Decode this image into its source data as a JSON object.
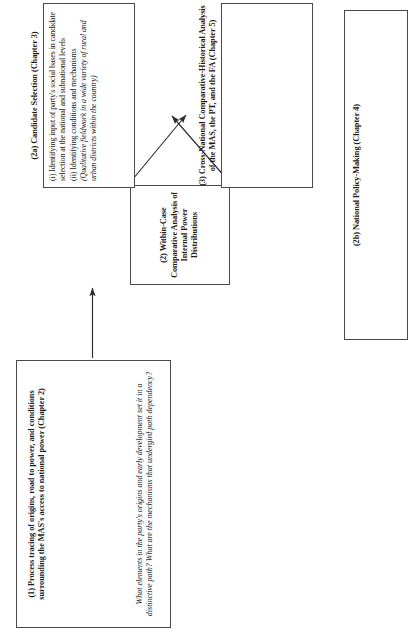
{
  "diagram": {
    "type": "research-design-flowchart",
    "orientation": "rotated-90-ccw",
    "line_color": "#4a4a4a",
    "background": "#ffffff",
    "nodes": [
      {
        "id": "node-1",
        "title": "(1) Process tracing of origins, road to power, and conditions surrounding the MAS's access to national power (Chapter 2)",
        "question": "What elements in the party's origins and early development set it in a distinctive path? What are the mechanisms that undergird path dependency?"
      },
      {
        "id": "node-2",
        "title": "(2) Within-Case Comparative Analysis of Internal Power Distributions",
        "question": ""
      },
      {
        "id": "node-2a",
        "title": "(2a) Candidate Selection (Chapter 3)",
        "items": [
          "(i) Identifying input of party's social bases in candidate selection at the national and subnational levels",
          "(ii) Identifying conditions and mechanisms",
          "(Qualitative fieldwork in a wide variety of rural and urban districts within the country)"
        ]
      },
      {
        "id": "node-2b",
        "title": "(2b) National Policy-Making (Chapter 4)",
        "items": [
          "(i) Identifying input of party's social bases in both steering the agenda and constraining the decision-making of power holders",
          "(ii) Identifying conditions and mechanisms",
          "(Qualitative fieldwork in party, as well as legislative and executive arenas)"
        ]
      },
      {
        "id": "node-3",
        "title": "(3) Cross-National Comparative-Historical Analysis of the MAS, the PT, and the FA (Chapter 5)",
        "question": "Why do some movement-based parties develop more top-down structures while others stay more open and responsive to their social bases?"
      }
    ],
    "connectors": [
      {
        "id": "arrow-1-to-2",
        "from": "node-1",
        "to": "node-2",
        "heads": "single"
      },
      {
        "id": "arrow-2-to-2b",
        "from": "node-2",
        "to": "node-2b",
        "heads": "single"
      },
      {
        "id": "arrow-2-to-2a",
        "from": "node-2",
        "to": "node-2a",
        "heads": "single"
      },
      {
        "id": "arrow-2a-to-3",
        "from": "node-2a",
        "to": "node-3",
        "heads": "double"
      }
    ]
  }
}
